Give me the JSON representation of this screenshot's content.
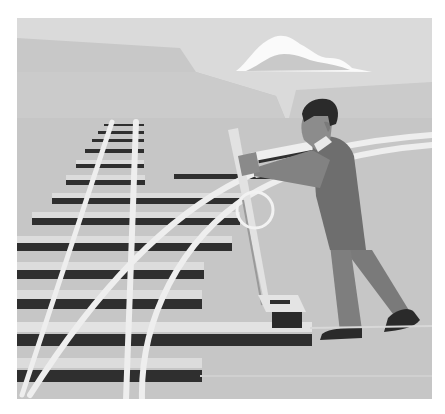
{
  "illustration": {
    "description": "Grayscale flat illustration of a man pulling a railroad switch lever, diverting tracks to a curved branch",
    "colors": {
      "background": "#ffffff",
      "sky": "#d9d9d9",
      "far_cliff": "#c6c6c6",
      "mid_ground": "#cfcfcf",
      "ground": "#c4c4c4",
      "tie_dark": "#2f2f2f",
      "tie_top": "#dcdcdc",
      "rail": "#eeeeee",
      "cloud": "#fafafa",
      "skin": "#8a8a8a",
      "hair": "#2a2a2a",
      "vest": "#6f6f6f",
      "trousers": "#7c7c7c",
      "shoes": "#2a2a2a",
      "lever": "#e2e2e2",
      "ring": "#f0f0f0"
    },
    "elements": [
      "sky",
      "cloud",
      "cliffs",
      "railroad-track",
      "ties",
      "curved-switch-rails",
      "switch-lever",
      "ring-handle",
      "lever-base",
      "worker"
    ]
  }
}
